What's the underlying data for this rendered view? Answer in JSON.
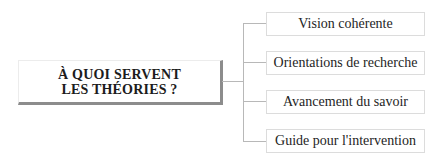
{
  "diagram": {
    "central": {
      "line1": "À QUOI SERVENT",
      "line2": "LES THÉORIES ?"
    },
    "branches": [
      {
        "label": "Vision cohérente"
      },
      {
        "label": "Orientations de recherche"
      },
      {
        "label": "Avancement du savoir"
      },
      {
        "label": "Guide pour l'intervention"
      }
    ],
    "colors": {
      "shadow": "#8c8c8c",
      "connector": "#b8b8b8",
      "box_border": "#dcdcdc"
    }
  }
}
